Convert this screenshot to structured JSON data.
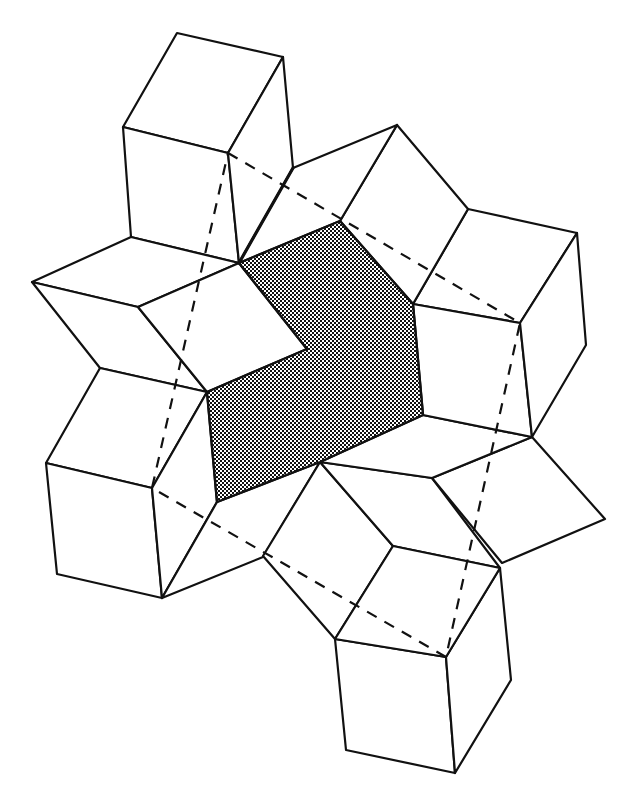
{
  "figure": {
    "kind": "geometric tiling diagram",
    "colors": {
      "line": "#111111",
      "background": "#ffffff",
      "shade_dot": "#111111",
      "shade_bg": "#ffffff"
    },
    "shaded_region": {
      "label": "central shaded polygon",
      "points": "239,263 340,221 413,304 423,415 320,462 217,502 207,392 307,349"
    },
    "dashed_parallelogram": {
      "label": "dashed connecting parallelogram",
      "points": "228,153 520,323 446,657 152,488"
    },
    "tiles": [
      {
        "name": "top-cube-top-face",
        "points": "177,33 283,57 228,153 123,127"
      },
      {
        "name": "top-cube-left-face",
        "points": "123,127 228,153 239,263 131,237"
      },
      {
        "name": "top-cube-right-face",
        "points": "283,57 293,168 239,263 228,153"
      },
      {
        "name": "left-rhombus-upper",
        "points": "131,237 239,263 138,307 32,282"
      },
      {
        "name": "left-rhombus-lower",
        "points": "32,282 138,307 207,392 100,368"
      },
      {
        "name": "left-rhombus-inner",
        "points": "138,307 239,263 307,349 207,392"
      },
      {
        "name": "lower-left-cube-top-face",
        "points": "100,368 207,392 152,488 46,463"
      },
      {
        "name": "lower-left-cube-left-face",
        "points": "46,463 152,488 162,598 57,574"
      },
      {
        "name": "lower-left-cube-right-face",
        "points": "152,488 207,392 217,502 162,598"
      },
      {
        "name": "lower-left-rhombus",
        "points": "162,598 217,502 320,462 263,557"
      },
      {
        "name": "bottom-rhombus-left",
        "points": "263,556 320,462 393,546 335,639"
      },
      {
        "name": "bottom-rhombus-right",
        "points": "320,462 432,478 500,568 393,546"
      },
      {
        "name": "bottom-cube-left-face",
        "points": "335,639 446,657 455,773 346,750"
      },
      {
        "name": "bottom-cube-right-face",
        "points": "446,657 500,568 511,680 455,773"
      },
      {
        "name": "bottom-cube-top-face",
        "points": "393,546 500,568 446,657 335,639"
      },
      {
        "name": "right-lower-rhombus",
        "points": "432,478 532,437 605,519 502,563"
      },
      {
        "name": "right-rhombus-inner",
        "points": "423,415 532,437 432,478 320,462"
      },
      {
        "name": "right-cube-top-face",
        "points": "468,209 577,233 520,323 413,304"
      },
      {
        "name": "right-cube-left-face",
        "points": "413,304 520,323 532,437 423,415"
      },
      {
        "name": "right-cube-right-face",
        "points": "520,323 577,233 586,345 532,437"
      },
      {
        "name": "top-rhombus-right",
        "points": "340,221 397,125 468,209 413,304"
      },
      {
        "name": "top-rhombus-left",
        "points": "293,168 397,125 340,221 239,263"
      }
    ],
    "bold_edges": [
      {
        "name": "seam-top-cube-to-center",
        "x1": 293,
        "y1": 168,
        "x2": 239,
        "y2": 263
      }
    ]
  }
}
